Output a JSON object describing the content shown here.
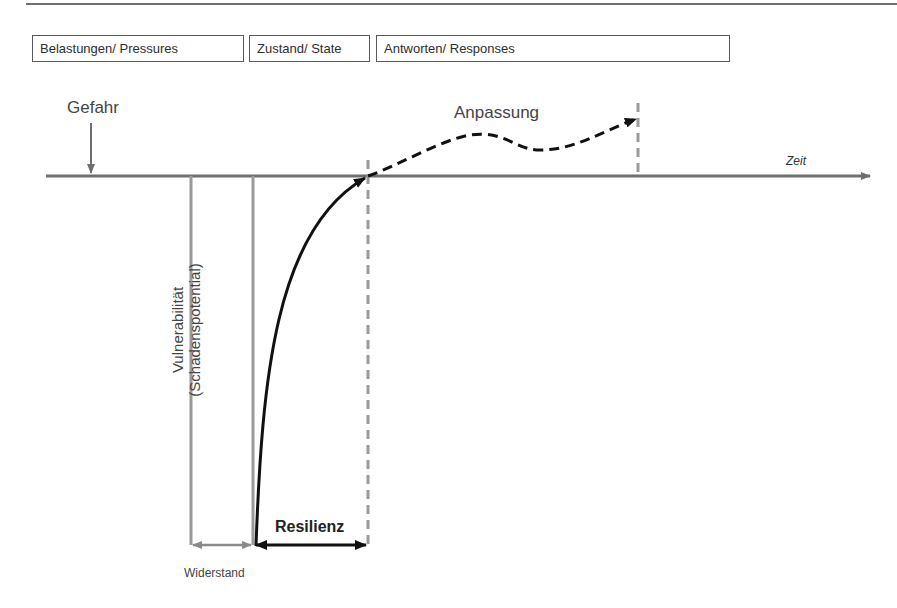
{
  "phases": [
    {
      "label": "Belastungen/ Pressures"
    },
    {
      "label": "Zustand/ State"
    },
    {
      "label": "Antworten/ Responses"
    }
  ],
  "labels": {
    "hazard": "Gefahr",
    "adaptation": "Anpassung",
    "time_axis": "Zeit",
    "vulnerability_line1": "Vulnerabilität",
    "vulnerability_line2": "(Schadenspotential)",
    "resilience": "Resilienz",
    "resistance": "Widerstand"
  },
  "colors": {
    "axis": "#6e6e6e",
    "grey_lines": "#9a9a9a",
    "curve": "#111111",
    "text": "#444444"
  }
}
